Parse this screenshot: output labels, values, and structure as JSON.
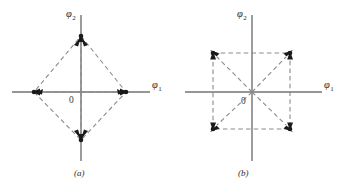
{
  "figure": {
    "background_color": "#ffffff",
    "axis_color": "#737373",
    "dash_color": "#8a8a8a",
    "point_color": "#1a1a1a",
    "panels": [
      {
        "id": "a",
        "caption": "(a)",
        "caption_x": 79,
        "caption_y": 174,
        "origin": {
          "x": 81,
          "y": 92,
          "label": "0",
          "label_x": 71,
          "label_y": 101
        },
        "axes": {
          "x": {
            "label": "φ",
            "subscript": "1",
            "x1": 12,
            "x2": 150,
            "label_x": 152,
            "label_y": 88
          },
          "y": {
            "label": "φ",
            "subscript": "2",
            "y1": 15,
            "y2": 161,
            "label_x": 67,
            "label_y": 16
          }
        },
        "constellation_shape": "diamond",
        "points": [
          {
            "name": "point-top",
            "x": 81,
            "y": 36,
            "phi1": 0,
            "phi2": 1,
            "arrow_angle_deg": -90
          },
          {
            "name": "point-right",
            "x": 126,
            "y": 92,
            "phi1": 1,
            "phi2": 0,
            "arrow_angle_deg": 0
          },
          {
            "name": "point-bottom",
            "x": 81,
            "y": 140,
            "phi1": 0,
            "phi2": -1,
            "arrow_angle_deg": 90
          },
          {
            "name": "point-left",
            "x": 34,
            "y": 92,
            "phi1": -1,
            "phi2": 0,
            "arrow_angle_deg": 180
          }
        ],
        "outline_path": "M 81 36 L 126 92 L 81 140 L 34 92 Z",
        "vectors": [
          {
            "name": "vector-to-top",
            "x1": 81,
            "y1": 92,
            "x2": 81,
            "y2": 36
          },
          {
            "name": "vector-to-right",
            "x1": 81,
            "y1": 92,
            "x2": 126,
            "y2": 92
          },
          {
            "name": "vector-to-bottom",
            "x1": 81,
            "y1": 92,
            "x2": 81,
            "y2": 140
          },
          {
            "name": "vector-to-left",
            "x1": 81,
            "y1": 92,
            "x2": 34,
            "y2": 92
          }
        ]
      },
      {
        "id": "b",
        "caption": "(b)",
        "caption_x": 243,
        "caption_y": 174,
        "origin": {
          "x": 252,
          "y": 92,
          "label": "0",
          "label_x": 243,
          "label_y": 102
        },
        "axes": {
          "x": {
            "label": "φ",
            "subscript": "1",
            "x1": 185,
            "x2": 322,
            "label_x": 324,
            "label_y": 88
          },
          "y": {
            "label": "φ",
            "subscript": "2",
            "y1": 15,
            "y2": 161,
            "label_x": 238,
            "label_y": 16
          }
        },
        "constellation_shape": "square",
        "points": [
          {
            "name": "point-top-left",
            "x": 213,
            "y": 53,
            "phi1": -1,
            "phi2": 1,
            "arrow_angle_deg": -135
          },
          {
            "name": "point-top-right",
            "x": 290,
            "y": 53,
            "phi1": 1,
            "phi2": 1,
            "arrow_angle_deg": -45
          },
          {
            "name": "point-bottom-right",
            "x": 290,
            "y": 129,
            "phi1": 1,
            "phi2": -1,
            "arrow_angle_deg": 45
          },
          {
            "name": "point-bottom-left",
            "x": 213,
            "y": 129,
            "phi1": -1,
            "phi2": -1,
            "arrow_angle_deg": 135
          }
        ],
        "outline_path": "M 213 53 L 290 53 L 290 129 L 213 129 Z",
        "vectors": [
          {
            "name": "vector-to-top-left",
            "x1": 252,
            "y1": 92,
            "x2": 213,
            "y2": 53
          },
          {
            "name": "vector-to-top-right",
            "x1": 252,
            "y1": 92,
            "x2": 290,
            "y2": 53
          },
          {
            "name": "vector-to-bottom-right",
            "x1": 252,
            "y1": 92,
            "x2": 290,
            "y2": 129
          },
          {
            "name": "vector-to-bottom-left",
            "x1": 252,
            "y1": 92,
            "x2": 213,
            "y2": 129
          }
        ]
      }
    ]
  }
}
